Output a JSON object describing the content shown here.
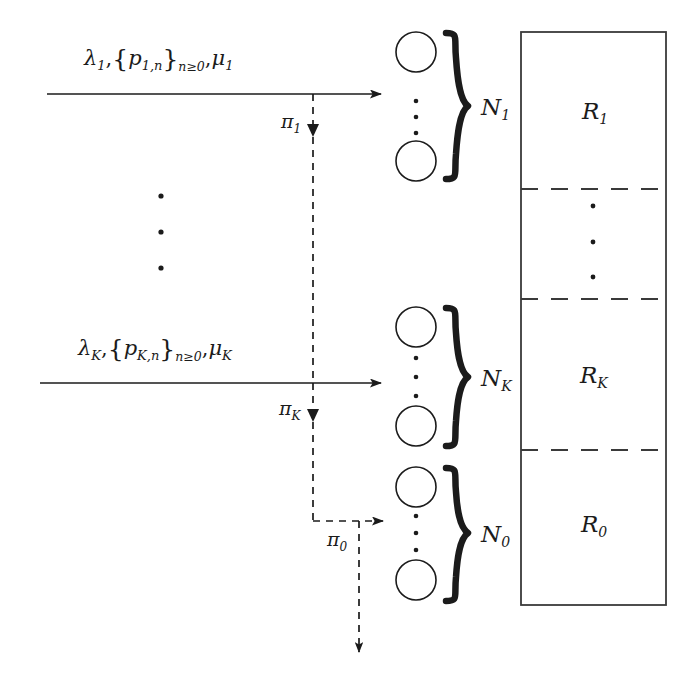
{
  "figure": {
    "type": "queueing-network-diagram",
    "background_color": "#ffffff",
    "ink_color": "#1b1b1b"
  },
  "streams": [
    {
      "id": "stream-1",
      "lambda": "λ",
      "lambda_sub": "1",
      "probabilities": "p",
      "probabilities_sub": "1,n",
      "probabilities_range": "n≥0",
      "mu": "μ",
      "mu_sub": "1",
      "full_label": "λ₁,{p₁,ₙ}ₙ≥₀ , μ₁",
      "routing_label": "π",
      "routing_sub": "1"
    },
    {
      "id": "stream-K",
      "lambda": "λ",
      "lambda_sub": "K",
      "probabilities": "p",
      "probabilities_sub": "K,n",
      "probabilities_range": "n≥0",
      "mu": "μ",
      "mu_sub": "K",
      "full_label": "λ_K,{p_K,n}ₙ≥₀ , μ_K",
      "routing_label": "π",
      "routing_sub": "K"
    }
  ],
  "overflow": {
    "routing_label": "π",
    "routing_sub": "0"
  },
  "server_groups": [
    {
      "id": "group-N1",
      "label": "N",
      "label_sub": "1",
      "circle_count_shown": 2,
      "ellipsis_dots": 3
    },
    {
      "id": "group-NK",
      "label": "N",
      "label_sub": "K",
      "circle_count_shown": 2,
      "ellipsis_dots": 3
    },
    {
      "id": "group-N0",
      "label": "N",
      "label_sub": "0",
      "circle_count_shown": 2,
      "ellipsis_dots": 3
    }
  ],
  "resource_blocks": [
    {
      "id": "block-R1",
      "label": "R",
      "label_sub": "1"
    },
    {
      "id": "block-ellipsis",
      "label": "",
      "label_sub": "",
      "ellipsis_dots": 3
    },
    {
      "id": "block-RK",
      "label": "R",
      "label_sub": "K"
    },
    {
      "id": "block-R0",
      "label": "R",
      "label_sub": "0"
    }
  ],
  "vertical_ellipsis_left": {
    "dots": 3
  }
}
